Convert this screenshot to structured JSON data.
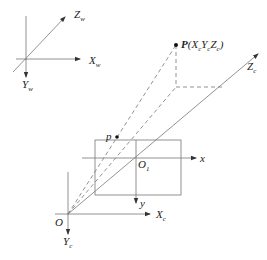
{
  "diagram": {
    "world_frame": {
      "axes": [
        {
          "name": "X",
          "sub": "w"
        },
        {
          "name": "Y",
          "sub": "w"
        },
        {
          "name": "Z",
          "sub": "w"
        }
      ]
    },
    "camera_frame": {
      "origin": "O",
      "axes": [
        {
          "name": "X",
          "sub": "c"
        },
        {
          "name": "Y",
          "sub": "c"
        },
        {
          "name": "Z",
          "sub": "c"
        }
      ]
    },
    "image_frame": {
      "origin": {
        "name": "O",
        "sub": "1"
      },
      "axes": [
        {
          "name": "x"
        },
        {
          "name": "y"
        }
      ]
    },
    "points": {
      "world_point": {
        "label": "P",
        "coords": "(X",
        "xs": "c",
        "y": "Y",
        "ys": "c",
        "z": "Z",
        "zs": "c",
        "close": ")"
      },
      "image_point": {
        "label": "p"
      }
    },
    "colors": {
      "line": "#555555",
      "text": "#222222",
      "background": "#ffffff"
    }
  }
}
